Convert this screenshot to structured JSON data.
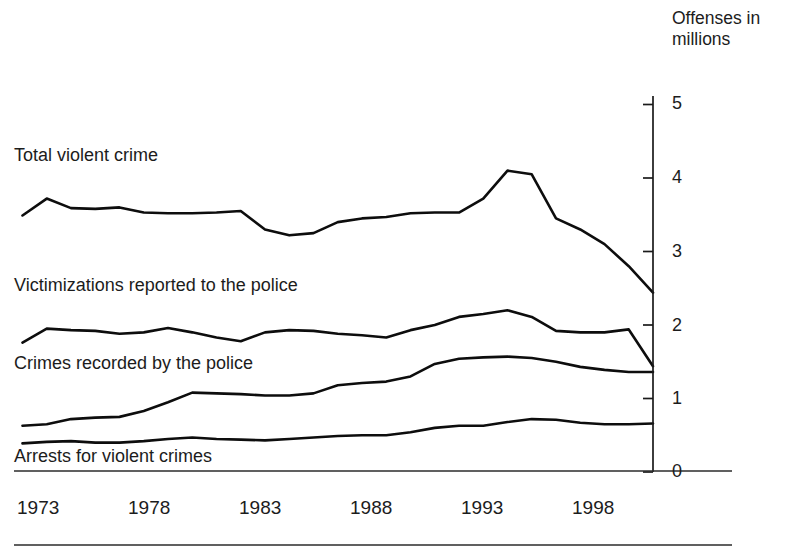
{
  "chart_data": {
    "type": "line",
    "title": "",
    "ylabel": "Offenses in millions",
    "xlabel": "",
    "ylim": [
      0,
      5
    ],
    "xlim": [
      1973,
      1999
    ],
    "yticks": [
      0,
      1,
      2,
      3,
      4,
      5
    ],
    "ytick_labels": [
      "0",
      "1",
      "2",
      "3",
      "4",
      "5"
    ],
    "xticks": [
      1973,
      1978,
      1983,
      1988,
      1993,
      1998
    ],
    "xtick_labels": [
      "1973",
      "1978",
      "1983",
      "1988",
      "1993",
      "1998"
    ],
    "grid": false,
    "legend_position": "inline-labels",
    "axis_position": "right",
    "x": [
      1973,
      1974,
      1975,
      1976,
      1977,
      1978,
      1979,
      1980,
      1981,
      1982,
      1983,
      1984,
      1985,
      1986,
      1987,
      1988,
      1989,
      1990,
      1991,
      1992,
      1993,
      1994,
      1995,
      1996,
      1997,
      1998,
      1999
    ],
    "series": [
      {
        "name": "Total violent crime",
        "color": "#0d0d0d",
        "values": [
          3.49,
          3.72,
          3.59,
          3.58,
          3.6,
          3.53,
          3.52,
          3.52,
          3.53,
          3.55,
          3.3,
          3.22,
          3.25,
          3.4,
          3.45,
          3.47,
          3.52,
          3.53,
          3.53,
          3.72,
          4.1,
          4.05,
          3.45,
          3.3,
          3.1,
          2.8,
          2.44
        ]
      },
      {
        "name": "Victimizations reported to the police",
        "color": "#0d0d0d",
        "values": [
          1.76,
          1.95,
          1.93,
          1.92,
          1.88,
          1.9,
          1.96,
          1.9,
          1.83,
          1.78,
          1.9,
          1.93,
          1.92,
          1.88,
          1.86,
          1.83,
          1.93,
          2.0,
          2.11,
          2.15,
          2.2,
          2.11,
          1.92,
          1.9,
          1.9,
          1.94,
          1.44
        ]
      },
      {
        "name": "Crimes recorded by the police",
        "color": "#0d0d0d",
        "values": [
          0.63,
          0.65,
          0.72,
          0.74,
          0.75,
          0.83,
          0.95,
          1.08,
          1.07,
          1.06,
          1.04,
          1.04,
          1.07,
          1.18,
          1.21,
          1.23,
          1.3,
          1.47,
          1.54,
          1.56,
          1.57,
          1.55,
          1.5,
          1.43,
          1.39,
          1.36,
          1.36
        ]
      },
      {
        "name": "Arrests for violent crimes",
        "color": "#0d0d0d",
        "values": [
          0.39,
          0.41,
          0.42,
          0.4,
          0.4,
          0.42,
          0.45,
          0.47,
          0.45,
          0.44,
          0.43,
          0.45,
          0.47,
          0.49,
          0.5,
          0.5,
          0.54,
          0.6,
          0.63,
          0.63,
          0.68,
          0.72,
          0.71,
          0.67,
          0.65,
          0.65,
          0.66
        ]
      }
    ],
    "series_label_positions": [
      {
        "label": "Total violent crime",
        "x_px": 14,
        "y_px": 145
      },
      {
        "label": "Victimizations reported to the police",
        "x_px": 14,
        "y_px": 275
      },
      {
        "label": "Crimes recorded by the police",
        "x_px": 14,
        "y_px": 353
      },
      {
        "label": "Arrests for violent crimes",
        "x_px": 14,
        "y_px": 446
      }
    ]
  },
  "axis": {
    "y_title_line1": "Offenses in",
    "y_title_line2": "millions"
  },
  "labels": {
    "series0": "Total violent crime",
    "series1": "Victimizations reported to the police",
    "series2": "Crimes recorded by the police",
    "series3": "Arrests for violent crimes"
  },
  "yticks": {
    "t5": "5",
    "t4": "4",
    "t3": "3",
    "t2": "2",
    "t1": "1",
    "t0": "0"
  },
  "xticks": {
    "t1973": "1973",
    "t1978": "1978",
    "t1983": "1983",
    "t1988": "1988",
    "t1993": "1993",
    "t1998": "1998"
  },
  "colors": {
    "line": "#0d0d0d",
    "axis": "#1a1a1a",
    "background": "#ffffff",
    "text": "#1c1c1c"
  }
}
